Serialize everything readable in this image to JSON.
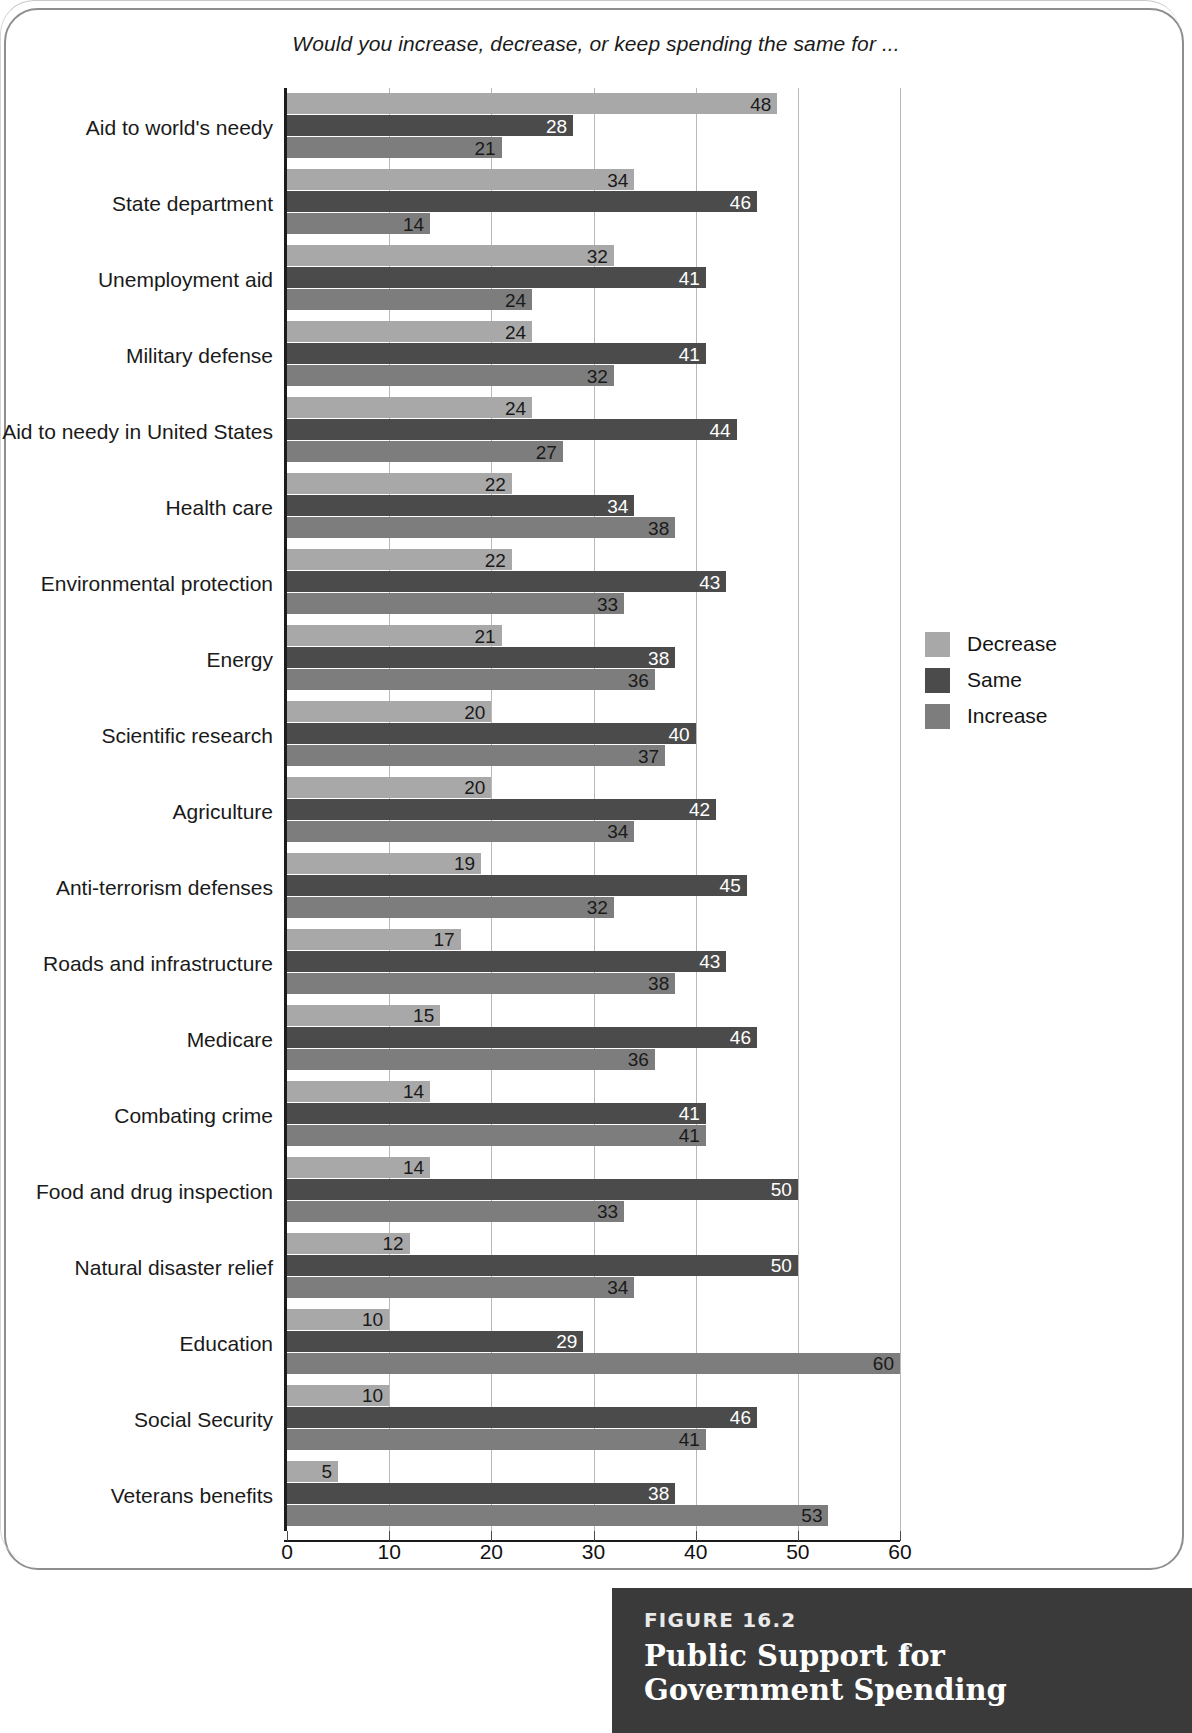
{
  "question": "Would you increase, decrease, or keep spending the same for ...",
  "legend": {
    "items": [
      {
        "label": "Decrease",
        "color": "#a8a8a8"
      },
      {
        "label": "Same",
        "color": "#4b4b4b"
      },
      {
        "label": "Increase",
        "color": "#7d7d7d"
      }
    ]
  },
  "caption": {
    "figure_number": "FIGURE 16.2",
    "title": "Public Support for Government Spending"
  },
  "chart_data": {
    "type": "bar",
    "orientation": "horizontal",
    "title": "Public Support for Government Spending",
    "subtitle": "Would you increase, decrease, or keep spending the same for ...",
    "xlabel": "",
    "ylabel": "",
    "xlim": [
      0,
      60
    ],
    "xticks": [
      0,
      10,
      20,
      30,
      40,
      50,
      60
    ],
    "xticklabels": [
      "0",
      "10",
      "20",
      "30",
      "40",
      "50",
      "60"
    ],
    "grid": "vertical",
    "legend_position": "right",
    "categories": [
      "Aid to world's needy",
      "State department",
      "Unemployment aid",
      "Military defense",
      "Aid to needy in United States",
      "Health care",
      "Environmental protection",
      "Energy",
      "Scientific research",
      "Agriculture",
      "Anti-terrorism defenses",
      "Roads and infrastructure",
      "Medicare",
      "Combating crime",
      "Food and drug inspection",
      "Natural disaster relief",
      "Education",
      "Social Security",
      "Veterans benefits"
    ],
    "series": [
      {
        "name": "Decrease",
        "color": "#a8a8a8",
        "values": [
          48,
          34,
          32,
          24,
          24,
          22,
          22,
          21,
          20,
          20,
          19,
          17,
          15,
          14,
          14,
          12,
          10,
          10,
          5
        ]
      },
      {
        "name": "Same",
        "color": "#4b4b4b",
        "values": [
          28,
          46,
          41,
          41,
          44,
          34,
          43,
          38,
          40,
          42,
          45,
          43,
          46,
          41,
          50,
          50,
          29,
          46,
          38
        ]
      },
      {
        "name": "Increase",
        "color": "#7d7d7d",
        "values": [
          21,
          14,
          24,
          32,
          27,
          38,
          33,
          36,
          37,
          34,
          32,
          38,
          36,
          41,
          33,
          34,
          60,
          41,
          53
        ]
      }
    ]
  }
}
